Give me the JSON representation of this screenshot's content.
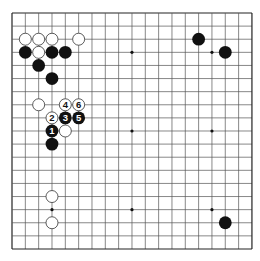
{
  "board": {
    "size": 19,
    "origin_x": 12,
    "origin_y": 13,
    "spacing_x": 13.33,
    "spacing_y": 13.11,
    "line_color": "#555555",
    "edge_color": "#222222",
    "background": "#ffffff",
    "star_points": [
      [
        3,
        3
      ],
      [
        9,
        3
      ],
      [
        15,
        3
      ],
      [
        3,
        9
      ],
      [
        9,
        9
      ],
      [
        15,
        9
      ],
      [
        3,
        15
      ],
      [
        9,
        15
      ],
      [
        15,
        15
      ]
    ]
  },
  "colors": {
    "black_stone": "#111111",
    "white_stone_fill": "#ffffff",
    "white_stone_stroke": "#333333",
    "label_on_black": "#ffffff",
    "label_on_white": "#111111"
  },
  "stones": [
    {
      "color": "white",
      "col": 1,
      "row": 2,
      "label": ""
    },
    {
      "color": "white",
      "col": 2,
      "row": 2,
      "label": ""
    },
    {
      "color": "white",
      "col": 3,
      "row": 2,
      "label": ""
    },
    {
      "color": "white",
      "col": 5,
      "row": 2,
      "label": ""
    },
    {
      "color": "black",
      "col": 1,
      "row": 3,
      "label": ""
    },
    {
      "color": "white",
      "col": 2,
      "row": 3,
      "label": ""
    },
    {
      "color": "black",
      "col": 3,
      "row": 3,
      "label": ""
    },
    {
      "color": "black",
      "col": 4,
      "row": 3,
      "label": ""
    },
    {
      "color": "black",
      "col": 2,
      "row": 4,
      "label": ""
    },
    {
      "color": "black",
      "col": 3,
      "row": 5,
      "label": ""
    },
    {
      "color": "white",
      "col": 2,
      "row": 7,
      "label": ""
    },
    {
      "color": "white",
      "col": 4,
      "row": 7,
      "label": "4"
    },
    {
      "color": "white",
      "col": 5,
      "row": 7,
      "label": "6"
    },
    {
      "color": "white",
      "col": 3,
      "row": 8,
      "label": "2"
    },
    {
      "color": "black",
      "col": 4,
      "row": 8,
      "label": "3"
    },
    {
      "color": "black",
      "col": 5,
      "row": 8,
      "label": "5"
    },
    {
      "color": "black",
      "col": 3,
      "row": 9,
      "label": "1"
    },
    {
      "color": "white",
      "col": 4,
      "row": 9,
      "label": ""
    },
    {
      "color": "black",
      "col": 3,
      "row": 10,
      "label": ""
    },
    {
      "color": "white",
      "col": 3,
      "row": 14,
      "label": ""
    },
    {
      "color": "white",
      "col": 3,
      "row": 16,
      "label": ""
    },
    {
      "color": "black",
      "col": 14,
      "row": 2,
      "label": ""
    },
    {
      "color": "black",
      "col": 16,
      "row": 3,
      "label": ""
    },
    {
      "color": "black",
      "col": 16,
      "row": 16,
      "label": ""
    }
  ]
}
